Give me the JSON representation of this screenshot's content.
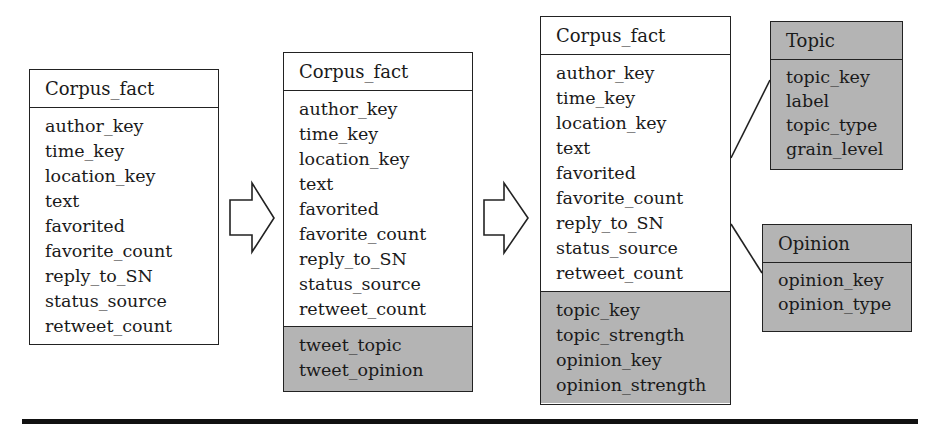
{
  "diagram": {
    "stage1": {
      "title": "Corpus_fact",
      "attributes": [
        "author_key",
        "time_key",
        "location_key",
        "text",
        "favorited",
        "favorite_count",
        "reply_to_SN",
        "status_source",
        "retweet_count"
      ]
    },
    "stage2": {
      "title": "Corpus_fact",
      "attributes": [
        "author_key",
        "time_key",
        "location_key",
        "text",
        "favorited",
        "favorite_count",
        "reply_to_SN",
        "status_source",
        "retweet_count"
      ],
      "added_attributes": [
        "tweet_topic",
        "tweet_opinion"
      ]
    },
    "stage3": {
      "title": "Corpus_fact",
      "attributes": [
        "author_key",
        "time_key",
        "location_key",
        "text",
        "favorited",
        "favorite_count",
        "reply_to_SN",
        "status_source",
        "retweet_count"
      ],
      "added_attributes": [
        "topic_key",
        "topic_strength",
        "opinion_key",
        "opinion_strength"
      ]
    },
    "topic_dimension": {
      "title": "Topic",
      "attributes": [
        "topic_key",
        "label",
        "topic_type",
        "grain_level"
      ]
    },
    "opinion_dimension": {
      "title": "Opinion",
      "attributes": [
        "opinion_key",
        "opinion_type"
      ]
    },
    "arrows": [
      "transform-arrow-1",
      "transform-arrow-2"
    ],
    "colors": {
      "shaded": "#b4b4b4",
      "line": "#222222"
    }
  }
}
